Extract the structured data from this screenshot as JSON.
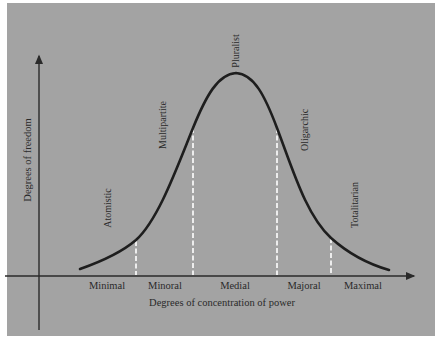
{
  "diagram": {
    "type": "bell-curve",
    "x_axis": {
      "title": "Degrees of concentration of power",
      "categories": [
        "Minimal",
        "Minoral",
        "Medial",
        "Majoral",
        "Maximal"
      ]
    },
    "y_axis": {
      "title": "Degrees of freedom"
    },
    "curve_labels": [
      "Atomistic",
      "Multipartite",
      "Pluralist",
      "Oligarchic",
      "Totalitarian"
    ],
    "colors": {
      "background": "#a3a3a3",
      "curve": "#1e1e1e",
      "axis": "#2a2a2a",
      "dashed_dividers": "#ffffff",
      "text": "#2a2a2a"
    }
  }
}
